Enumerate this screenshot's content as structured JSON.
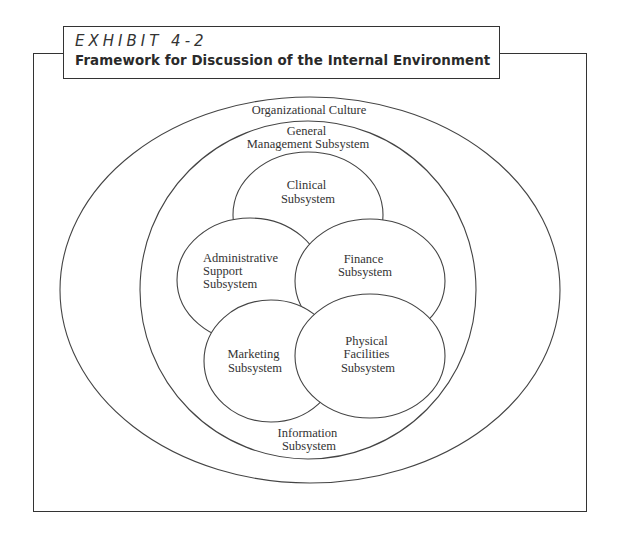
{
  "exhibit": {
    "label": "EXHIBIT 4-2",
    "title": "Framework for Discussion of the Internal Environment"
  },
  "diagram": {
    "organizational_culture": "Organizational Culture",
    "general_management": [
      "General",
      "Management Subsystem"
    ],
    "clinical": [
      "Clinical",
      "Subsystem"
    ],
    "administrative": [
      "Administrative",
      "Support",
      "Subsystem"
    ],
    "finance": [
      "Finance",
      "Subsystem"
    ],
    "marketing": [
      "Marketing",
      "Subsystem"
    ],
    "physical_facilities": [
      "Physical",
      "Facilities",
      "Subsystem"
    ],
    "information": [
      "Information",
      "Subsystem"
    ]
  }
}
